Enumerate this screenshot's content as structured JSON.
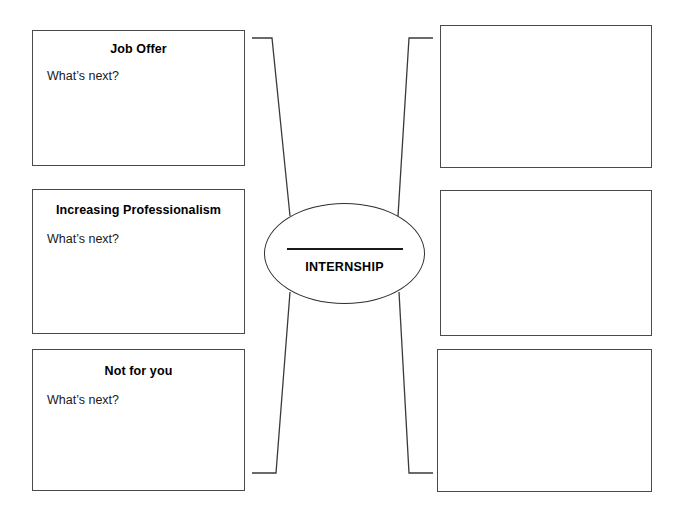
{
  "diagram": {
    "hub": {
      "label": "INTERNSHIP",
      "blank_line": ""
    },
    "left_boxes": [
      {
        "title": "Job Offer",
        "subtitle": "What’s next?"
      },
      {
        "title": "Increasing Professionalism",
        "subtitle": "What’s next?"
      },
      {
        "title": "Not for you",
        "subtitle": "What’s next?"
      }
    ],
    "right_boxes": [
      {
        "content": ""
      },
      {
        "content": ""
      },
      {
        "content": ""
      }
    ],
    "colors": {
      "box_border": "#4a4a4a",
      "hub_border": "#2f2f2f",
      "connector": "#3a3a3a",
      "page_background": "#ffffff",
      "text": "#000000"
    }
  }
}
